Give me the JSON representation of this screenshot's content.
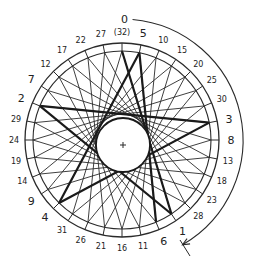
{
  "diagram": {
    "center": {
      "x": 122,
      "y": 140
    },
    "outer_ring_radius": 97,
    "inner_ring_radius": 89,
    "hub_radius": 27,
    "label_radius": 108,
    "point_count": 32,
    "chord_skip": 13,
    "start_label": "0",
    "top_label": "(32)",
    "labels_clockwise_from_top": [
      "(32)",
      "5",
      "10",
      "15",
      "20",
      "25",
      "30",
      "3",
      "8",
      "13",
      "18",
      "23",
      "28",
      "1",
      "6",
      "11",
      "16",
      "21",
      "26",
      "31",
      "4",
      "9",
      "14",
      "19",
      "24",
      "29",
      "2",
      "7",
      "12",
      "17",
      "22",
      "27"
    ],
    "large_labels": [
      "5",
      "3",
      "8",
      "1",
      "6",
      "4",
      "9",
      "2",
      "7"
    ],
    "thick_chords": [
      [
        0,
        1
      ],
      [
        1,
        2
      ],
      [
        2,
        3
      ],
      [
        3,
        4
      ],
      [
        4,
        5
      ],
      [
        5,
        6
      ]
    ],
    "direction_arc": {
      "radius": 121,
      "start_angle_deg": 5,
      "end_angle_deg": 150,
      "arrow": "clockwise"
    },
    "colors": {
      "line": "#2a2a2a",
      "thick_line": "#1a1a1a",
      "background": "#ffffff"
    }
  }
}
